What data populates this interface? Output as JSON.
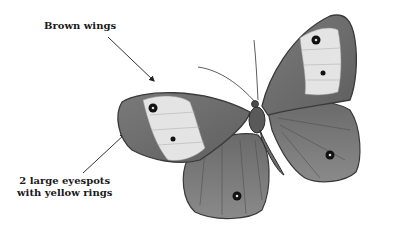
{
  "annotations": {
    "brown_wings": {
      "text": "Brown wings"
    },
    "eyespots": {
      "line1": "2 large eyespots",
      "line2": "with yellow rings"
    }
  },
  "illustration": {
    "subject": "butterfly",
    "style": "grayscale drawing",
    "colors": {
      "wing_dark": "#6e6e6e",
      "wing_mid": "#8a8a8a",
      "wing_patch": "#e4e4e4",
      "eyespot": "#111111",
      "outline": "#3a3a3a",
      "arrow": "#333333"
    }
  }
}
